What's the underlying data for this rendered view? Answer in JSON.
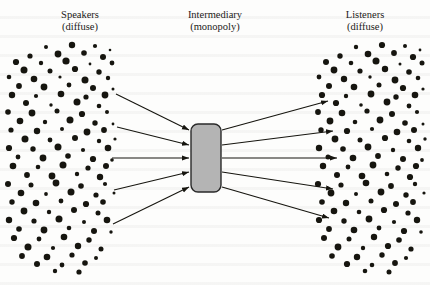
{
  "figure": {
    "type": "bowtie-intermediary-diagram",
    "background_color": "#fdfdfc",
    "ink_color": "#16150f"
  },
  "labels": {
    "speakers": {
      "title": "Speakers",
      "subtitle": "(diffuse)"
    },
    "intermediary": {
      "title": "Intermediary",
      "subtitle": "(monopoly)"
    },
    "listeners": {
      "title": "Listeners",
      "subtitle": "(diffuse)"
    }
  },
  "intermediary_box": {
    "fill_color": "#b4b4b4",
    "stroke_color": "#2a2a2a",
    "x": 191,
    "y": 124,
    "width": 30,
    "height": 68,
    "corner_radius": 7
  },
  "arrows": {
    "stroke_color": "#16150f",
    "stroke_width": 1.1,
    "head_length": 7,
    "head_width": 4.6,
    "incoming": [
      {
        "x1": 116,
        "y1": 94,
        "x2": 189,
        "y2": 130
      },
      {
        "x1": 117,
        "y1": 127,
        "x2": 189,
        "y2": 145
      },
      {
        "x1": 112,
        "y1": 158,
        "x2": 189,
        "y2": 158
      },
      {
        "x1": 114,
        "y1": 190,
        "x2": 189,
        "y2": 172
      },
      {
        "x1": 113,
        "y1": 224,
        "x2": 189,
        "y2": 187
      }
    ],
    "outgoing": [
      {
        "x1": 222,
        "y1": 130,
        "x2": 328,
        "y2": 101
      },
      {
        "x1": 222,
        "y1": 145,
        "x2": 333,
        "y2": 131
      },
      {
        "x1": 222,
        "y1": 158,
        "x2": 337,
        "y2": 158
      },
      {
        "x1": 222,
        "y1": 172,
        "x2": 333,
        "y2": 189
      },
      {
        "x1": 222,
        "y1": 187,
        "x2": 329,
        "y2": 218
      }
    ]
  },
  "dot_fields": {
    "dot_color": "#16150f",
    "left": {
      "name": "speakers-dot-field",
      "bounds": {
        "x": 8,
        "y": 42,
        "width": 108,
        "height": 228
      },
      "dots": [
        [
          46,
          47,
          2.0
        ],
        [
          72,
          45,
          3.2
        ],
        [
          95,
          46,
          2.1
        ],
        [
          110,
          50,
          1.3
        ],
        [
          30,
          56,
          2.6
        ],
        [
          58,
          54,
          3.4
        ],
        [
          84,
          53,
          2.8
        ],
        [
          103,
          57,
          3.0
        ],
        [
          16,
          62,
          3.1
        ],
        [
          41,
          63,
          2.2
        ],
        [
          66,
          61,
          3.6
        ],
        [
          90,
          64,
          1.4
        ],
        [
          112,
          63,
          2.4
        ],
        [
          24,
          70,
          3.5
        ],
        [
          50,
          71,
          2.5
        ],
        [
          75,
          69,
          3.1
        ],
        [
          99,
          72,
          2.7
        ],
        [
          9,
          77,
          2.3
        ],
        [
          34,
          79,
          3.3
        ],
        [
          60,
          77,
          1.6
        ],
        [
          85,
          80,
          3.5
        ],
        [
          108,
          78,
          2.2
        ],
        [
          19,
          86,
          2.9
        ],
        [
          44,
          87,
          3.4
        ],
        [
          69,
          85,
          2.4
        ],
        [
          93,
          88,
          3.0
        ],
        [
          113,
          89,
          1.5
        ],
        [
          12,
          95,
          3.2
        ],
        [
          36,
          96,
          2.1
        ],
        [
          61,
          94,
          3.3
        ],
        [
          86,
          97,
          2.6
        ],
        [
          105,
          95,
          3.4
        ],
        [
          26,
          103,
          3.0
        ],
        [
          51,
          105,
          1.7
        ],
        [
          77,
          102,
          3.5
        ],
        [
          99,
          106,
          2.3
        ],
        [
          8,
          112,
          2.8
        ],
        [
          32,
          113,
          3.4
        ],
        [
          57,
          111,
          2.5
        ],
        [
          82,
          114,
          3.1
        ],
        [
          107,
          112,
          2.0
        ],
        [
          20,
          121,
          3.3
        ],
        [
          45,
          122,
          2.2
        ],
        [
          70,
          120,
          3.5
        ],
        [
          95,
          123,
          2.7
        ],
        [
          113,
          124,
          1.4
        ],
        [
          11,
          130,
          2.6
        ],
        [
          37,
          131,
          3.2
        ],
        [
          62,
          129,
          2.0
        ],
        [
          87,
          132,
          3.4
        ],
        [
          104,
          130,
          2.9
        ],
        [
          25,
          139,
          3.5
        ],
        [
          50,
          140,
          2.4
        ],
        [
          75,
          138,
          3.0
        ],
        [
          99,
          141,
          2.2
        ],
        [
          115,
          139,
          1.6
        ],
        [
          9,
          148,
          3.1
        ],
        [
          33,
          149,
          2.7
        ],
        [
          58,
          147,
          3.5
        ],
        [
          83,
          150,
          2.1
        ],
        [
          108,
          148,
          3.3
        ],
        [
          18,
          157,
          2.4
        ],
        [
          43,
          158,
          3.4
        ],
        [
          68,
          156,
          2.8
        ],
        [
          93,
          159,
          3.1
        ],
        [
          112,
          160,
          1.8
        ],
        [
          13,
          166,
          3.3
        ],
        [
          38,
          167,
          2.3
        ],
        [
          63,
          165,
          3.5
        ],
        [
          88,
          168,
          2.6
        ],
        [
          106,
          166,
          3.0
        ],
        [
          27,
          175,
          2.9
        ],
        [
          52,
          176,
          3.4
        ],
        [
          77,
          174,
          2.2
        ],
        [
          100,
          177,
          3.2
        ],
        [
          8,
          184,
          3.0
        ],
        [
          31,
          185,
          2.5
        ],
        [
          56,
          183,
          3.4
        ],
        [
          81,
          186,
          2.8
        ],
        [
          105,
          184,
          2.1
        ],
        [
          21,
          193,
          3.3
        ],
        [
          46,
          194,
          1.9
        ],
        [
          71,
          192,
          3.5
        ],
        [
          96,
          195,
          2.6
        ],
        [
          114,
          193,
          1.5
        ],
        [
          12,
          202,
          2.7
        ],
        [
          36,
          203,
          3.3
        ],
        [
          61,
          201,
          2.4
        ],
        [
          86,
          204,
          3.1
        ],
        [
          103,
          202,
          2.8
        ],
        [
          24,
          211,
          3.4
        ],
        [
          49,
          212,
          2.2
        ],
        [
          74,
          210,
          3.0
        ],
        [
          98,
          213,
          2.5
        ],
        [
          9,
          220,
          3.2
        ],
        [
          34,
          221,
          2.6
        ],
        [
          59,
          219,
          3.5
        ],
        [
          84,
          222,
          2.0
        ],
        [
          107,
          220,
          3.3
        ],
        [
          19,
          229,
          2.8
        ],
        [
          44,
          230,
          3.4
        ],
        [
          69,
          228,
          2.3
        ],
        [
          94,
          231,
          3.0
        ],
        [
          111,
          232,
          1.7
        ],
        [
          14,
          238,
          3.1
        ],
        [
          39,
          239,
          2.4
        ],
        [
          64,
          237,
          3.3
        ],
        [
          89,
          240,
          2.7
        ],
        [
          28,
          247,
          3.5
        ],
        [
          53,
          248,
          2.1
        ],
        [
          78,
          246,
          3.2
        ],
        [
          101,
          249,
          2.5
        ],
        [
          22,
          256,
          2.9
        ],
        [
          47,
          257,
          3.3
        ],
        [
          72,
          255,
          2.6
        ],
        [
          96,
          258,
          2.0
        ],
        [
          37,
          264,
          3.0
        ],
        [
          62,
          265,
          2.4
        ],
        [
          85,
          263,
          2.8
        ],
        [
          55,
          271,
          2.2
        ],
        [
          79,
          272,
          2.6
        ]
      ]
    },
    "right": {
      "name": "listeners-dot-field",
      "bounds": {
        "x": 318,
        "y": 42,
        "width": 108,
        "height": 228
      },
      "dots": [
        [
          356,
          47,
          2.2
        ],
        [
          382,
          45,
          3.1
        ],
        [
          405,
          46,
          2.0
        ],
        [
          420,
          50,
          1.4
        ],
        [
          340,
          56,
          2.7
        ],
        [
          368,
          54,
          3.3
        ],
        [
          394,
          53,
          2.9
        ],
        [
          413,
          57,
          3.1
        ],
        [
          326,
          62,
          3.0
        ],
        [
          351,
          63,
          2.3
        ],
        [
          376,
          61,
          3.5
        ],
        [
          400,
          64,
          1.5
        ],
        [
          422,
          63,
          2.5
        ],
        [
          334,
          70,
          3.4
        ],
        [
          360,
          71,
          2.6
        ],
        [
          385,
          69,
          3.2
        ],
        [
          409,
          72,
          2.8
        ],
        [
          319,
          77,
          2.4
        ],
        [
          344,
          79,
          3.2
        ],
        [
          370,
          77,
          1.7
        ],
        [
          395,
          80,
          3.4
        ],
        [
          418,
          78,
          2.3
        ],
        [
          329,
          86,
          3.0
        ],
        [
          354,
          87,
          3.3
        ],
        [
          379,
          85,
          2.5
        ],
        [
          403,
          88,
          3.1
        ],
        [
          423,
          89,
          1.6
        ],
        [
          322,
          95,
          3.1
        ],
        [
          346,
          96,
          2.2
        ],
        [
          371,
          94,
          3.4
        ],
        [
          396,
          97,
          2.7
        ],
        [
          415,
          95,
          3.3
        ],
        [
          336,
          103,
          3.1
        ],
        [
          361,
          105,
          1.8
        ],
        [
          387,
          102,
          3.4
        ],
        [
          409,
          106,
          2.4
        ],
        [
          318,
          112,
          2.9
        ],
        [
          342,
          113,
          3.3
        ],
        [
          367,
          111,
          2.6
        ],
        [
          392,
          114,
          3.0
        ],
        [
          417,
          112,
          2.1
        ],
        [
          330,
          121,
          3.4
        ],
        [
          355,
          122,
          2.3
        ],
        [
          380,
          120,
          3.4
        ],
        [
          405,
          123,
          2.8
        ],
        [
          423,
          124,
          1.5
        ],
        [
          321,
          130,
          2.7
        ],
        [
          347,
          131,
          3.1
        ],
        [
          372,
          129,
          2.1
        ],
        [
          397,
          132,
          3.3
        ],
        [
          414,
          130,
          3.0
        ],
        [
          335,
          139,
          3.4
        ],
        [
          360,
          140,
          2.5
        ],
        [
          385,
          138,
          3.1
        ],
        [
          409,
          141,
          2.3
        ],
        [
          425,
          139,
          1.7
        ],
        [
          319,
          148,
          3.2
        ],
        [
          343,
          149,
          2.8
        ],
        [
          368,
          147,
          3.4
        ],
        [
          393,
          150,
          2.2
        ],
        [
          418,
          148,
          3.2
        ],
        [
          328,
          157,
          2.5
        ],
        [
          353,
          158,
          3.3
        ],
        [
          378,
          156,
          2.9
        ],
        [
          403,
          159,
          3.0
        ],
        [
          422,
          160,
          1.9
        ],
        [
          323,
          166,
          3.2
        ],
        [
          348,
          167,
          2.4
        ],
        [
          373,
          165,
          3.4
        ],
        [
          398,
          168,
          2.7
        ],
        [
          416,
          166,
          3.1
        ],
        [
          337,
          175,
          3.0
        ],
        [
          362,
          176,
          3.3
        ],
        [
          387,
          174,
          2.3
        ],
        [
          410,
          177,
          3.1
        ],
        [
          318,
          184,
          3.1
        ],
        [
          341,
          185,
          2.6
        ],
        [
          366,
          183,
          3.3
        ],
        [
          391,
          186,
          2.9
        ],
        [
          415,
          184,
          2.2
        ],
        [
          331,
          193,
          3.4
        ],
        [
          356,
          194,
          2.0
        ],
        [
          381,
          192,
          3.4
        ],
        [
          406,
          195,
          2.7
        ],
        [
          424,
          193,
          1.6
        ],
        [
          322,
          202,
          2.8
        ],
        [
          346,
          203,
          3.2
        ],
        [
          371,
          201,
          2.5
        ],
        [
          396,
          204,
          3.0
        ],
        [
          413,
          202,
          2.9
        ],
        [
          334,
          211,
          3.3
        ],
        [
          359,
          212,
          2.3
        ],
        [
          384,
          210,
          3.1
        ],
        [
          408,
          213,
          2.6
        ],
        [
          319,
          220,
          3.1
        ],
        [
          344,
          221,
          2.7
        ],
        [
          369,
          219,
          3.4
        ],
        [
          394,
          222,
          2.1
        ],
        [
          417,
          220,
          3.2
        ],
        [
          329,
          229,
          2.9
        ],
        [
          354,
          230,
          3.3
        ],
        [
          379,
          228,
          2.4
        ],
        [
          404,
          231,
          3.1
        ],
        [
          421,
          232,
          1.8
        ],
        [
          324,
          238,
          3.0
        ],
        [
          349,
          239,
          2.5
        ],
        [
          374,
          237,
          3.2
        ],
        [
          399,
          240,
          2.8
        ],
        [
          338,
          247,
          3.4
        ],
        [
          363,
          248,
          2.2
        ],
        [
          388,
          246,
          3.1
        ],
        [
          411,
          249,
          2.6
        ],
        [
          332,
          256,
          2.8
        ],
        [
          357,
          257,
          3.2
        ],
        [
          382,
          255,
          2.7
        ],
        [
          406,
          258,
          2.1
        ],
        [
          347,
          264,
          3.1
        ],
        [
          372,
          265,
          2.3
        ],
        [
          395,
          263,
          2.9
        ],
        [
          365,
          271,
          2.3
        ],
        [
          389,
          272,
          2.5
        ]
      ]
    }
  }
}
